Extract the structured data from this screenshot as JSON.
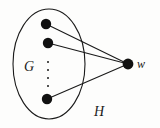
{
  "figure": {
    "type": "graph-diagram",
    "caption_labels": {
      "inner_set": "G",
      "outer_set": "H",
      "outer_vertex": "w"
    },
    "colors": {
      "background": "#fdfdfc",
      "ink": "#1a1a1a",
      "vertex_fill": "#111111",
      "edge_stroke": "#1a1a1a",
      "ellipse_stroke": "#1a1a1a"
    },
    "ellipse": {
      "name": "G",
      "cx": 49,
      "cy": 64,
      "rx": 36,
      "ry": 55,
      "stroke_width": 1.1
    },
    "vertices": [
      {
        "id": "v1",
        "label": "",
        "cx": 46,
        "cy": 24,
        "r": 5.2,
        "inside": "G"
      },
      {
        "id": "v2",
        "label": "",
        "cx": 48,
        "cy": 43,
        "r": 5.2,
        "inside": "G"
      },
      {
        "id": "v3",
        "label": "",
        "cx": 47,
        "cy": 99,
        "r": 5.2,
        "inside": "G"
      },
      {
        "id": "w",
        "label": "w",
        "cx": 128,
        "cy": 64,
        "r": 5.4,
        "inside": "H"
      }
    ],
    "ellipsis_dots": [
      {
        "cx": 48,
        "cy": 62,
        "r": 1.0
      },
      {
        "cx": 48,
        "cy": 70,
        "r": 1.0
      },
      {
        "cx": 48,
        "cy": 78,
        "r": 1.0
      },
      {
        "cx": 48,
        "cy": 86,
        "r": 1.0
      }
    ],
    "edges": [
      {
        "from": "v1",
        "to": "w",
        "x1": 46,
        "y1": 24,
        "x2": 128,
        "y2": 64
      },
      {
        "from": "v2",
        "to": "w",
        "x1": 48,
        "y1": 43,
        "x2": 128,
        "y2": 64
      },
      {
        "from": "v3",
        "to": "w",
        "x1": 47,
        "y1": 99,
        "x2": 128,
        "y2": 64
      }
    ]
  }
}
